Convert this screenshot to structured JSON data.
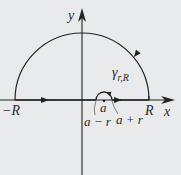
{
  "diagram": {
    "type": "contour-integration",
    "colors": {
      "background": "#e9eaeb",
      "stroke": "#222222"
    },
    "axes": {
      "x_label": "x",
      "y_label": "y"
    },
    "labels": {
      "minus_R": "−R",
      "R": "R",
      "a": "a",
      "a_minus_r": "a − r",
      "a_plus_r": "a + r",
      "contour_name": "γ",
      "contour_subscript": "r,R"
    }
  }
}
